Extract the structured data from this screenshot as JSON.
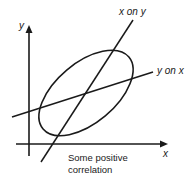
{
  "diagram": {
    "axis_labels": {
      "x": "x",
      "y": "y"
    },
    "lines": {
      "x_on_y": "x on y",
      "y_on_x": "y on x"
    },
    "caption": {
      "line1": "Some positive",
      "line2": "correlation"
    },
    "colors": {
      "stroke": "#1a1a1a",
      "background": "#ffffff"
    }
  }
}
